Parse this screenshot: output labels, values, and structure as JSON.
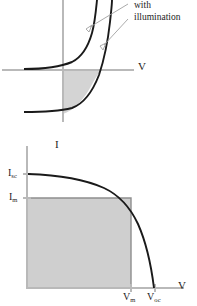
{
  "figure": {
    "kind": "solar-cell-iv-characteristics",
    "panels": [
      {
        "id": "top",
        "name": "diode-iv-with-and-without-illumination",
        "annotation": {
          "line1": "with",
          "line2": "illumination"
        },
        "axes": {
          "x_label": "V",
          "y_label": "I"
        },
        "curves": [
          {
            "name": "dark-curve",
            "label": ""
          },
          {
            "name": "illuminated-curve",
            "label": ""
          }
        ],
        "shaded_region": {
          "name": "power-quadrant-shading"
        }
      },
      {
        "id": "bottom",
        "name": "photovoltaic-iv-curve-with-max-power-rectangle",
        "axes": {
          "x_label": "V",
          "y_label": "I"
        },
        "ticks": {
          "y": [
            {
              "base": "I",
              "subscript": "sc"
            },
            {
              "base": "I",
              "subscript": "m"
            }
          ],
          "x": [
            {
              "base": "V",
              "subscript": "m"
            },
            {
              "base": "V",
              "subscript": "oc"
            }
          ]
        },
        "shaded_region": {
          "name": "maximum-power-rectangle"
        }
      }
    ],
    "colors": {
      "curve": "#1a1a1a",
      "axis": "#b9b9b9",
      "shade": "#d4d4d4",
      "leader": "#a0a0a0",
      "text": "#1c1c1c"
    }
  }
}
